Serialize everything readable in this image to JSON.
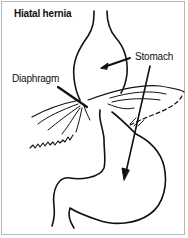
{
  "diagram": {
    "title": "Hiatal hernia",
    "labels": {
      "stomach": "Stomach",
      "diaphragm": "Diaphragm"
    },
    "colors": {
      "line": "#111111",
      "border": "#b8b8b8",
      "background": "#ffffff"
    }
  }
}
